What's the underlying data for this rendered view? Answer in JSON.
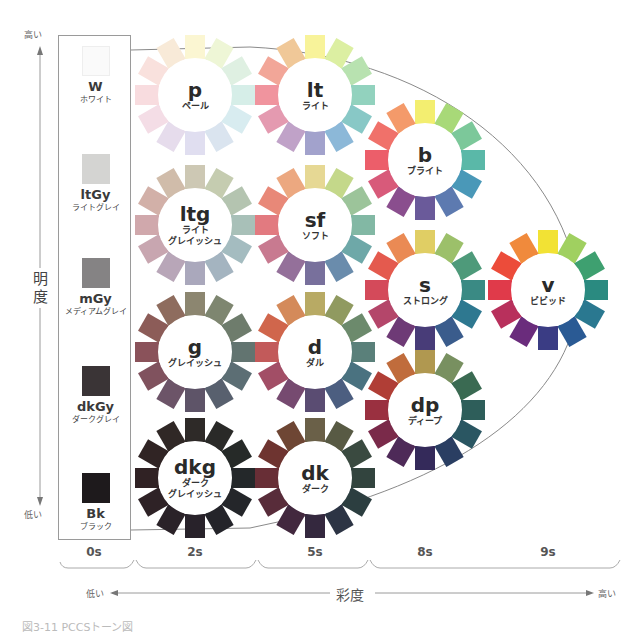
{
  "axes": {
    "lightness": {
      "title": "明度",
      "high": "高い",
      "low": "低い"
    },
    "saturation": {
      "title": "彩度",
      "low": "低い",
      "high": "高い"
    }
  },
  "columns": [
    {
      "label": "0s",
      "x": 94
    },
    {
      "label": "2s",
      "x": 195
    },
    {
      "label": "5s",
      "x": 315
    },
    {
      "label": "8s",
      "x": 425
    },
    {
      "label": "9s",
      "x": 548
    }
  ],
  "achromatic": [
    {
      "code": "W",
      "name": "ホワイト",
      "color": "#fafafa"
    },
    {
      "code": "ltGy",
      "name": "ライトグレイ",
      "color": "#d4d4d2"
    },
    {
      "code": "mGy",
      "name": "メディアムグレイ",
      "color": "#858384"
    },
    {
      "code": "dkGy",
      "name": "ダークグレイ",
      "color": "#3a3436"
    },
    {
      "code": "Bk",
      "name": "ブラック",
      "color": "#1e1a1c"
    }
  ],
  "tones": [
    {
      "code": "p",
      "name": "ペール",
      "name2": "",
      "cx": 195,
      "cy": 95,
      "colors": [
        "#fbf6d2",
        "#eef6d6",
        "#dff0e2",
        "#d6eee8",
        "#d8ecf0",
        "#dae4ef",
        "#e0def0",
        "#e6dcec",
        "#f4dde6",
        "#f8dcdf",
        "#f9e1dd",
        "#f8ead8"
      ]
    },
    {
      "code": "lt",
      "name": "ライト",
      "name2": "",
      "cx": 315,
      "cy": 95,
      "colors": [
        "#f8f39a",
        "#dcefa2",
        "#b8e2b0",
        "#92d2be",
        "#88c8c6",
        "#8cb8d8",
        "#a2a2cc",
        "#c0a2c8",
        "#e49ab0",
        "#f0949e",
        "#f2a698",
        "#f0c898"
      ]
    },
    {
      "code": "b",
      "name": "ブライト",
      "name2": "",
      "cx": 425,
      "cy": 160,
      "colors": [
        "#f3ee70",
        "#a8d978",
        "#7cc89a",
        "#5ab8a8",
        "#4a98b8",
        "#5d7ab0",
        "#6a5a9a",
        "#8a4e8e",
        "#d85a7a",
        "#ec5e6a",
        "#f0716a",
        "#f49a6a"
      ]
    },
    {
      "code": "ltg",
      "name": "ライト",
      "name2": "グレイッシュ",
      "cx": 195,
      "cy": 225,
      "colors": [
        "#cdc8b4",
        "#c5ccb0",
        "#b4c4b0",
        "#a8c0b8",
        "#a4bcc0",
        "#a4b4c0",
        "#aaa8bc",
        "#b8a6b8",
        "#c8a6b0",
        "#d0a8ac",
        "#d2b0a8",
        "#d0bcaa"
      ]
    },
    {
      "code": "sf",
      "name": "ソフト",
      "name2": "",
      "cx": 315,
      "cy": 225,
      "colors": [
        "#e6d894",
        "#c4d88a",
        "#9cc49a",
        "#82b8a4",
        "#6ea8a8",
        "#6a8cac",
        "#78709c",
        "#94709a",
        "#c87a90",
        "#e27a80",
        "#e88878",
        "#eca880"
      ]
    },
    {
      "code": "s",
      "name": "ストロング",
      "name2": "",
      "cx": 425,
      "cy": 290,
      "colors": [
        "#e0ce64",
        "#9cc06a",
        "#4e9a7a",
        "#3a8a84",
        "#2e7890",
        "#3a5c8c",
        "#483c78",
        "#6e3a76",
        "#b4466a",
        "#d44a5a",
        "#e45a4e",
        "#ea8a54"
      ]
    },
    {
      "code": "v",
      "name": "ビビッド",
      "name2": "",
      "cx": 548,
      "cy": 290,
      "colors": [
        "#f2e234",
        "#a0d060",
        "#3ea070",
        "#2a8a80",
        "#2a7890",
        "#2a5a94",
        "#3a3c84",
        "#6a2c7c",
        "#b8305c",
        "#e03a4a",
        "#ec4c3a",
        "#f08a3c"
      ]
    },
    {
      "code": "g",
      "name": "グレイッシュ",
      "name2": "",
      "cx": 195,
      "cy": 352,
      "colors": [
        "#8c8670",
        "#7e8670",
        "#6e7c6c",
        "#627470",
        "#5c6e74",
        "#58606e",
        "#5e5468",
        "#6c5468",
        "#80525e",
        "#8a525a",
        "#8c5c58",
        "#8e6c5e"
      ]
    },
    {
      "code": "d",
      "name": "ダル",
      "name2": "",
      "cx": 315,
      "cy": 352,
      "colors": [
        "#b8aa64",
        "#909a60",
        "#6c8a6c",
        "#5a807a",
        "#4a7280",
        "#4c5e80",
        "#5a4c72",
        "#764a70",
        "#a24e66",
        "#c25a5a",
        "#d0664c",
        "#d48a5a"
      ]
    },
    {
      "code": "dp",
      "name": "ディープ",
      "name2": "",
      "cx": 425,
      "cy": 410,
      "colors": [
        "#b09850",
        "#789060",
        "#3a6a52",
        "#2e5e5a",
        "#2a5662",
        "#2a3e62",
        "#342a5a",
        "#4e2a58",
        "#7a2a4a",
        "#9a3040",
        "#b03e36",
        "#c06c3c"
      ]
    },
    {
      "code": "dkg",
      "name": "ダーク",
      "name2": "グレイッシュ",
      "cx": 195,
      "cy": 478,
      "colors": [
        "#2e2a28",
        "#2a2a28",
        "#262a28",
        "#24282a",
        "#24262a",
        "#24242a",
        "#28222a",
        "#2a2228",
        "#2e2226",
        "#302224",
        "#302424",
        "#302826"
      ]
    },
    {
      "code": "dk",
      "name": "ダーク",
      "name2": "",
      "cx": 315,
      "cy": 478,
      "colors": [
        "#6a6048",
        "#585a44",
        "#3a4a40",
        "#32443e",
        "#2c3e40",
        "#2c3444",
        "#34283e",
        "#42283e",
        "#582c3a",
        "#682e36",
        "#6e3430",
        "#6e4634"
      ]
    }
  ],
  "caption": "図3-11 PCCSトーン図"
}
